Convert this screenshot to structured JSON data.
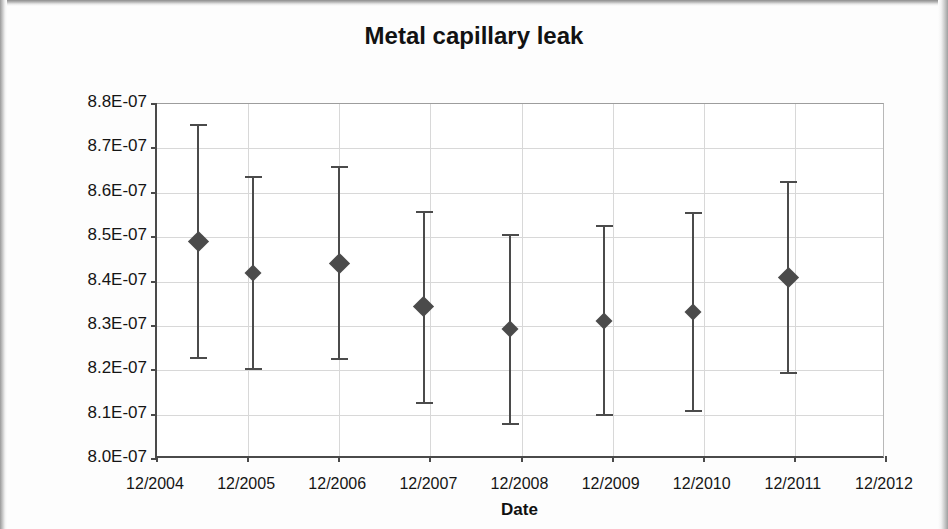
{
  "chart": {
    "title": "Metal capillary leak",
    "x_axis_title": "Date",
    "y_axis_title_prefix": "Throughput at 20℃ in Pa·m",
    "y_axis_title_sup1": "3",
    "y_axis_title_mid": "·s",
    "y_axis_title_sup2": "-1"
  },
  "chart_data": {
    "type": "scatter",
    "title": "Metal capillary leak",
    "xlabel": "Date",
    "ylabel": "Throughput at 20℃ in Pa·m3·s-1",
    "grid": true,
    "legend": "none",
    "xlim": [
      "12/2004",
      "12/2012"
    ],
    "ylim": [
      8e-07,
      8.8e-07
    ],
    "ytick_labels": [
      "8.8E-07",
      "8.7E-07",
      "8.6E-07",
      "8.5E-07",
      "8.4E-07",
      "8.3E-07",
      "8.2E-07",
      "8.1E-07",
      "8.0E-07"
    ],
    "ytick_values": [
      8.8e-07,
      8.7e-07,
      8.6e-07,
      8.5e-07,
      8.4e-07,
      8.3e-07,
      8.2e-07,
      8.1e-07,
      8e-07
    ],
    "xtick_labels": [
      "12/2004",
      "12/2005",
      "12/2006",
      "12/2007",
      "12/2008",
      "12/2009",
      "12/2010",
      "12/2011",
      "12/2012"
    ],
    "xtick_positions": [
      2004.95,
      2005.95,
      2006.95,
      2007.95,
      2008.95,
      2009.95,
      2010.95,
      2011.95,
      2012.95
    ],
    "series": [
      {
        "name": "Throughput",
        "marker": "diamond",
        "color": "#4b4b4b",
        "error_bars": "y",
        "points": [
          {
            "x": 2005.4,
            "y": 8.49e-07,
            "y_low": 8.225e-07,
            "y_high": 8.755e-07
          },
          {
            "x": 2006.0,
            "y": 8.42e-07,
            "y_low": 8.2e-07,
            "y_high": 8.638e-07
          },
          {
            "x": 2006.95,
            "y": 8.44e-07,
            "y_low": 8.222e-07,
            "y_high": 8.66e-07
          },
          {
            "x": 2007.88,
            "y": 8.343e-07,
            "y_low": 8.125e-07,
            "y_high": 8.558e-07
          },
          {
            "x": 2008.82,
            "y": 8.292e-07,
            "y_low": 8.077e-07,
            "y_high": 8.507e-07
          },
          {
            "x": 2009.85,
            "y": 8.312e-07,
            "y_low": 8.097e-07,
            "y_high": 8.527e-07
          },
          {
            "x": 2010.83,
            "y": 8.332e-07,
            "y_low": 8.107e-07,
            "y_high": 8.557e-07
          },
          {
            "x": 2011.88,
            "y": 8.41e-07,
            "y_low": 8.192e-07,
            "y_high": 8.627e-07
          }
        ]
      }
    ]
  }
}
